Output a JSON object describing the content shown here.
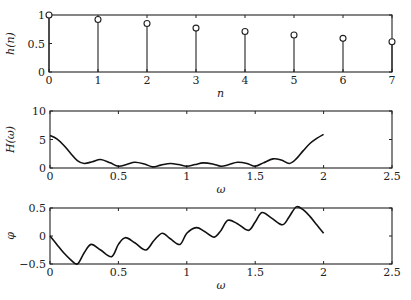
{
  "chart_data": [
    {
      "type": "stem",
      "title": "",
      "xlabel": "n",
      "ylabel": "h(n)",
      "x": [
        0,
        1,
        2,
        3,
        4,
        5,
        6,
        7
      ],
      "values": [
        1.0,
        0.92,
        0.85,
        0.77,
        0.71,
        0.65,
        0.59,
        0.53
      ],
      "xlim": [
        0,
        7
      ],
      "ylim": [
        0,
        1
      ],
      "xticks": [
        "0",
        "1",
        "2",
        "3",
        "4",
        "5",
        "6",
        "7"
      ],
      "yticks": [
        "0",
        "0.5",
        "1"
      ],
      "grid": false
    },
    {
      "type": "line",
      "title": "",
      "xlabel": "ω",
      "ylabel": "H(ω)",
      "x": [
        0,
        0.05,
        0.1,
        0.15,
        0.2,
        0.25,
        0.31,
        0.37,
        0.44,
        0.5,
        0.56,
        0.62,
        0.69,
        0.75,
        0.81,
        0.88,
        0.94,
        1.0,
        1.06,
        1.12,
        1.19,
        1.25,
        1.31,
        1.37,
        1.44,
        1.5,
        1.56,
        1.63,
        1.69,
        1.75,
        1.8,
        1.85,
        1.9,
        1.95,
        2.0
      ],
      "values": [
        5.7,
        5.1,
        4.0,
        2.6,
        1.3,
        0.8,
        1.1,
        1.5,
        0.9,
        0.3,
        0.6,
        1.0,
        0.7,
        0.2,
        0.5,
        0.8,
        0.6,
        0.3,
        0.6,
        0.9,
        0.7,
        0.3,
        0.6,
        1.0,
        0.8,
        0.3,
        0.9,
        1.6,
        1.4,
        0.8,
        1.6,
        3.0,
        4.3,
        5.2,
        5.9
      ],
      "xlim": [
        0,
        2.5
      ],
      "ylim": [
        0,
        10
      ],
      "xticks": [
        "0",
        "0.5",
        "1",
        "1.5",
        "2",
        "2.5"
      ],
      "yticks": [
        "0",
        "5",
        "10"
      ],
      "grid": false
    },
    {
      "type": "line",
      "title": "",
      "xlabel": "ω",
      "ylabel": "φ",
      "x": [
        0,
        0.05,
        0.1,
        0.15,
        0.2,
        0.25,
        0.3,
        0.37,
        0.45,
        0.5,
        0.55,
        0.62,
        0.7,
        0.76,
        0.82,
        0.88,
        0.95,
        1.0,
        1.07,
        1.13,
        1.2,
        1.25,
        1.3,
        1.37,
        1.45,
        1.5,
        1.55,
        1.62,
        1.7,
        1.75,
        1.8,
        1.85,
        1.9,
        1.95,
        2.0
      ],
      "values": [
        0,
        -0.15,
        -0.3,
        -0.42,
        -0.5,
        -0.3,
        -0.15,
        -0.25,
        -0.37,
        -0.15,
        -0.03,
        -0.12,
        -0.25,
        -0.08,
        0.05,
        -0.05,
        -0.15,
        0.05,
        0.15,
        0.08,
        -0.02,
        0.1,
        0.28,
        0.22,
        0.1,
        0.25,
        0.42,
        0.32,
        0.2,
        0.35,
        0.52,
        0.47,
        0.35,
        0.2,
        0.05
      ],
      "xlim": [
        0,
        2.5
      ],
      "ylim": [
        -0.5,
        0.5
      ],
      "xticks": [
        "0",
        "0.5",
        "1",
        "1.5",
        "2",
        "2.5"
      ],
      "yticks": [
        "-0.5",
        "0",
        "0.5"
      ],
      "grid": false
    }
  ]
}
